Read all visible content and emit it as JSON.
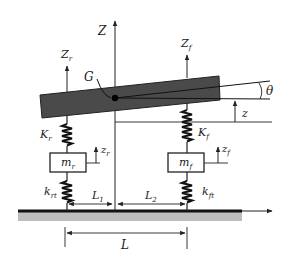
{
  "diagram": {
    "labels": {
      "Z_axis": "Z",
      "Zr": "Z",
      "Zr_sub": "r",
      "Zf": "Z",
      "Zf_sub": "f",
      "G": "G",
      "theta": "θ",
      "z": "z",
      "Kr": "K",
      "Kr_sub": "r",
      "Kf": "K",
      "Kf_sub": "f",
      "mr": "m",
      "mr_sub": "r",
      "mf": "m",
      "mf_sub": "f",
      "zr": "z",
      "zr_sub": "r",
      "zf": "z",
      "zf_sub": "f",
      "krt": "k",
      "krt_sub": "rt",
      "kft": "k",
      "kft_sub": "ft",
      "L1": "L",
      "L1_sub": "1",
      "L2": "L",
      "L2_sub": "2",
      "L": "L"
    },
    "colors": {
      "body": "#4a4a4a",
      "ground": "#111111",
      "ground_fill": "#bdbdbd",
      "line": "#222222"
    }
  }
}
